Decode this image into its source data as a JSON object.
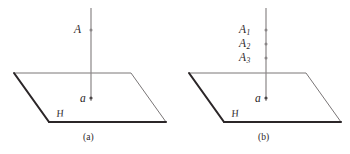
{
  "figure": {
    "background_color": "#ffffff",
    "ink_color": "#2b2628",
    "thin_line_color": "#6e6a6b",
    "panels": [
      {
        "id": "a",
        "caption": "(a)",
        "plane_label": "H",
        "foot_label": "a",
        "point_labels": [
          {
            "base": "A",
            "sub": ""
          }
        ]
      },
      {
        "id": "b",
        "caption": "(b)",
        "plane_label": "H",
        "foot_label": "a",
        "point_labels": [
          {
            "base": "A",
            "sub": "1"
          },
          {
            "base": "A",
            "sub": "2"
          },
          {
            "base": "A",
            "sub": "3"
          }
        ]
      }
    ]
  }
}
